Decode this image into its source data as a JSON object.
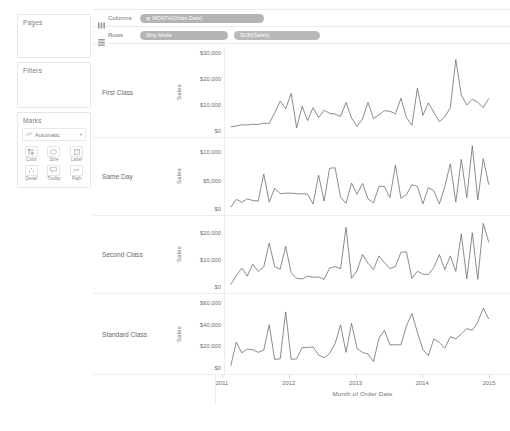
{
  "sidebar": {
    "cards": [
      {
        "title": "Pages",
        "name": "pages-card"
      },
      {
        "title": "Filters",
        "name": "filters-card"
      },
      {
        "title": "Marks",
        "name": "marks-card"
      }
    ],
    "marks": {
      "type_label": "Automatic",
      "type_icon": "line-chart-icon",
      "caret_icon": "chevron-down-icon",
      "buttons": [
        {
          "label": "Color",
          "icon": "color-icon"
        },
        {
          "label": "Size",
          "icon": "size-icon"
        },
        {
          "label": "Label",
          "icon": "label-icon"
        },
        {
          "label": "Detail",
          "icon": "detail-icon"
        },
        {
          "label": "Tooltip",
          "icon": "tooltip-icon"
        },
        {
          "label": "Path",
          "icon": "path-icon"
        }
      ]
    }
  },
  "shelves": {
    "columns": {
      "label": "Columns",
      "icon": "columns-shelf-icon",
      "pills": [
        {
          "text": "MONTH(Order Date)",
          "kind": "dimension",
          "prefix": "☷"
        }
      ]
    },
    "rows": {
      "label": "Rows",
      "icon": "rows-shelf-icon",
      "pills": [
        {
          "text": "Ship Mode",
          "kind": "dimension",
          "prefix": ""
        },
        {
          "text": "SUM(Sales)",
          "kind": "measure",
          "prefix": ""
        }
      ]
    }
  },
  "chart_data": {
    "type": "line",
    "title": "",
    "xlabel": "Month of Order Date",
    "ylabel": "Sales",
    "x_tick_labels": [
      "2011",
      "2012",
      "2013",
      "2014",
      "2015"
    ],
    "grid": false,
    "legend": "none",
    "small_multiples_by": "Ship Mode",
    "panels": [
      {
        "name": "First Class",
        "ylabel": "Sales",
        "ylim": [
          0,
          30000
        ],
        "y_ticks": [
          0,
          10000,
          20000,
          30000
        ],
        "y_tick_labels": [
          "$0",
          "$10,000",
          "$20,000",
          "$30,000"
        ],
        "values": [
          1600,
          1900,
          2400,
          2300,
          2600,
          2500,
          3000,
          2900,
          7000,
          11500,
          8500,
          14500,
          1200,
          9500,
          4000,
          9000,
          5200,
          8000,
          6800,
          6500,
          5600,
          11000,
          5000,
          1800,
          4600,
          11000,
          4800,
          6200,
          7800,
          7600,
          6600,
          12600,
          5200,
          2200,
          16500,
          6000,
          10800,
          7200,
          3600,
          5400,
          9000,
          27500,
          13800,
          10000,
          12200,
          11000,
          9000,
          12500
        ]
      },
      {
        "name": "Same Day",
        "ylabel": "Sales",
        "ylim": [
          0,
          11500
        ],
        "y_ticks": [
          0,
          5000,
          10000
        ],
        "y_tick_labels": [
          "$0",
          "$5,000",
          "$10,000"
        ],
        "values": [
          300,
          1700,
          1200,
          1800,
          1500,
          1400,
          6200,
          1200,
          3700,
          2700,
          2800,
          2800,
          2700,
          2700,
          2600,
          900,
          6000,
          1400,
          7200,
          7300,
          2100,
          1000,
          4600,
          2600,
          4500,
          1800,
          1100,
          4000,
          4000,
          2000,
          7800,
          1900,
          2500,
          4300,
          4000,
          900,
          3800,
          3200,
          900,
          4000,
          8000,
          1200,
          8800,
          2000,
          11200,
          1600,
          8900,
          4300
        ]
      },
      {
        "name": "Second Class",
        "ylabel": "Sales",
        "ylim": [
          0,
          24000
        ],
        "y_ticks": [
          0,
          10000,
          20000
        ],
        "y_tick_labels": [
          "$0",
          "$10,000",
          "$20,000"
        ],
        "values": [
          900,
          4200,
          7000,
          4000,
          8400,
          5800,
          7400,
          16200,
          7500,
          6600,
          15000,
          5200,
          3200,
          3000,
          4000,
          3600,
          3700,
          2800,
          7000,
          7500,
          6800,
          22000,
          3200,
          6000,
          12000,
          8800,
          6400,
          11500,
          9000,
          6800,
          7600,
          12800,
          13000,
          3200,
          5800,
          4800,
          4600,
          7200,
          12000,
          6400,
          11500,
          5800,
          19600,
          3000,
          20000,
          2800,
          23500,
          16500
        ]
      },
      {
        "name": "Standard Class",
        "ylabel": "Sales",
        "ylim": [
          0,
          63000
        ],
        "y_ticks": [
          0,
          20000,
          40000,
          60000
        ],
        "y_tick_labels": [
          "$0",
          "$20,000",
          "$40,000",
          "$60,000"
        ],
        "values": [
          2000,
          24000,
          14000,
          17500,
          17000,
          14500,
          16500,
          40000,
          8000,
          8500,
          52000,
          8000,
          8500,
          19000,
          19000,
          19500,
          12000,
          9500,
          13500,
          22500,
          40000,
          14500,
          41500,
          18000,
          14500,
          13000,
          6000,
          27500,
          35000,
          21500,
          21500,
          21500,
          39000,
          50500,
          33000,
          17000,
          11500,
          27000,
          23500,
          18500,
          29000,
          27000,
          31500,
          36500,
          35000,
          42500,
          55500,
          45500
        ]
      }
    ]
  }
}
